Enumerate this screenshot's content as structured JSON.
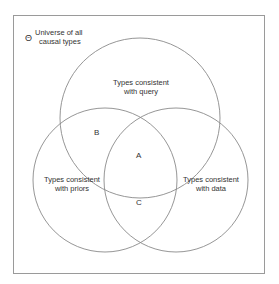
{
  "diagram": {
    "type": "venn",
    "universe": {
      "symbol": "Θ",
      "label_line1": "Universe of all",
      "label_line2": "causal types"
    },
    "sets": [
      {
        "id": "query",
        "line1": "Types consistent",
        "line2": "with query"
      },
      {
        "id": "priors",
        "line1": "Types consistent",
        "line2": "with priors"
      },
      {
        "id": "data",
        "line1": "Types consistent",
        "line2": "with data"
      }
    ],
    "regions": {
      "A": "A",
      "B": "B",
      "C": "C"
    },
    "colors": {
      "frame": "#9a9a9a",
      "circle": "#8a8a8a",
      "text": "#333333"
    }
  }
}
